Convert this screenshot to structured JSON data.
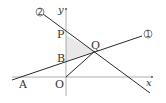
{
  "diagram": {
    "axes": {
      "x_label": "x",
      "y_label": "y",
      "origin_label": "O"
    },
    "points": {
      "A": "A",
      "B": "B",
      "P": "P",
      "Q": "Q",
      "O": "O"
    },
    "lines": [
      {
        "id": "line-1",
        "label": "①",
        "through": [
          "A",
          "B",
          "Q"
        ]
      },
      {
        "id": "line-2",
        "label": "②",
        "through": [
          "P",
          "Q"
        ]
      }
    ],
    "segments": [
      {
        "id": "segment-OQ",
        "from": "O",
        "to": "Q"
      }
    ],
    "shaded_region": {
      "vertices": [
        "P",
        "B",
        "Q"
      ],
      "color": "#e6e6e6"
    },
    "colors": {
      "line": "#222222",
      "axis": "#888888",
      "shade": "#e6e6e6"
    }
  }
}
